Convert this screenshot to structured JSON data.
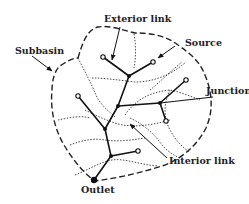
{
  "diagram": {
    "type": "stream-network-subbasin",
    "labels": {
      "subbasin": "Subbasin",
      "exterior_link": "Exterior link",
      "source": "Source",
      "junction": "Junction",
      "interior_link": "Interior link",
      "outlet": "Outlet"
    },
    "colors": {
      "line": "#222222",
      "background": "#ffffff"
    },
    "legend_semantics": {
      "open_circle": "Source node",
      "filled_dot": "Junction / outlet node",
      "solid_line": "Stream link",
      "dashed_line": "Subbasin boundary",
      "dotted_line": "Internal divide"
    }
  }
}
